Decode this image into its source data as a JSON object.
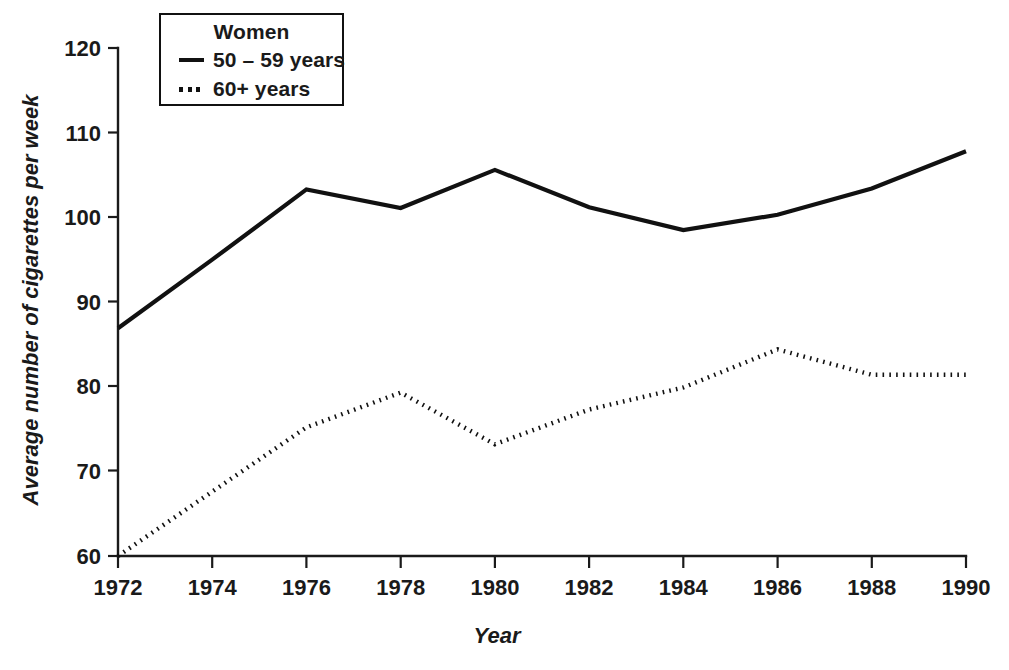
{
  "chart_data": {
    "type": "line",
    "title": "",
    "xlabel": "Year",
    "ylabel": "Average number of cigarettes per week",
    "x": [
      1972,
      1974,
      1976,
      1978,
      1980,
      1982,
      1984,
      1986,
      1988,
      1990
    ],
    "xtick_labels": [
      "1972",
      "1974",
      "1976",
      "1978",
      "1980",
      "1982",
      "1984",
      "1986",
      "1988",
      "1990"
    ],
    "ytick_labels": [
      "60",
      "70",
      "80",
      "90",
      "100",
      "110",
      "120"
    ],
    "yticks": [
      60,
      70,
      80,
      90,
      100,
      110,
      120
    ],
    "xlim": [
      1972,
      1990
    ],
    "ylim": [
      60,
      120
    ],
    "grid": false,
    "legend_position": "top-left-inside",
    "legend_title": "Women",
    "series": [
      {
        "name": "50 – 59 years",
        "style": "solid",
        "color": "#111111",
        "values": [
          86.9,
          95.0,
          103.3,
          101.1,
          105.6,
          101.2,
          98.5,
          100.3,
          103.4,
          107.8
        ]
      },
      {
        "name": "60+ years",
        "style": "dotted",
        "color": "#111111",
        "values": [
          60.0,
          67.6,
          75.2,
          79.3,
          73.2,
          77.3,
          79.9,
          84.4,
          81.4,
          81.4
        ]
      }
    ]
  },
  "legend": {
    "title": "Women",
    "entries": [
      {
        "label": "50 – 59 years",
        "style": "solid"
      },
      {
        "label": "60+ years",
        "style": "dotted"
      }
    ]
  },
  "axes": {
    "x_title": "Year",
    "y_title": "Average number of cigarettes per week"
  }
}
